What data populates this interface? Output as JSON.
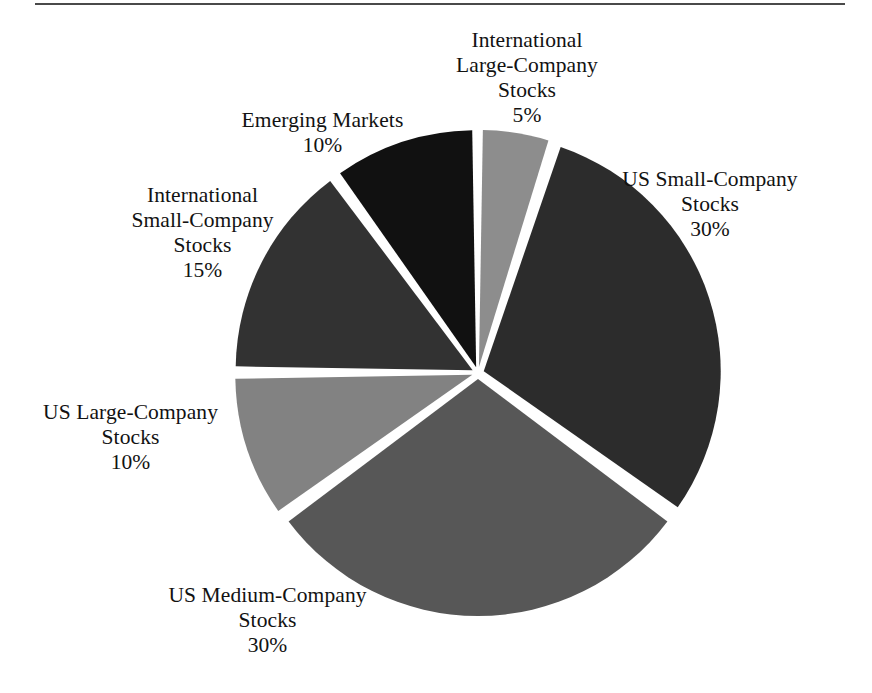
{
  "figure": {
    "has_top_rule": true,
    "background": "#ffffff"
  },
  "chart_data": {
    "type": "pie",
    "title": "",
    "xlabel": "",
    "ylabel": "",
    "units": "percent",
    "total": 100,
    "start_angle_deg": 0,
    "direction": "clockwise",
    "exploded": true,
    "gap_style": "white-separators",
    "legend": "none",
    "labels_position": "outside-callout-free",
    "categories": [
      "International Large-Company Stocks",
      "US Small-Company Stocks",
      "US Medium-Company Stocks",
      "US Large-Company Stocks",
      "International Small-Company Stocks",
      "Emerging Markets"
    ],
    "values": [
      5,
      30,
      30,
      10,
      15,
      10
    ],
    "colors": [
      "#8d8d8d",
      "#2c2c2c",
      "#575757",
      "#828282",
      "#323232",
      "#111111"
    ],
    "slices": [
      {
        "name": "International Large-Company Stocks",
        "label_line1": "International",
        "label_line2": "Large-Company",
        "label_line3": "Stocks",
        "value": 5,
        "percent": "5%",
        "color": "#8d8d8d"
      },
      {
        "name": "US Small-Company Stocks",
        "label_line1": "US Small-Company",
        "label_line2": "Stocks",
        "label_line3": "",
        "value": 30,
        "percent": "30%",
        "color": "#2c2c2c"
      },
      {
        "name": "US Medium-Company Stocks",
        "label_line1": "US Medium-Company",
        "label_line2": "Stocks",
        "label_line3": "",
        "value": 30,
        "percent": "30%",
        "color": "#575757"
      },
      {
        "name": "US Large-Company Stocks",
        "label_line1": "US Large-Company",
        "label_line2": "Stocks",
        "label_line3": "",
        "value": 10,
        "percent": "10%",
        "color": "#828282"
      },
      {
        "name": "International Small-Company Stocks",
        "label_line1": "International",
        "label_line2": "Small-Company",
        "label_line3": "Stocks",
        "value": 15,
        "percent": "15%",
        "color": "#323232"
      },
      {
        "name": "Emerging Markets",
        "label_line1": "Emerging Markets",
        "label_line2": "",
        "label_line3": "",
        "value": 10,
        "percent": "10%",
        "color": "#111111"
      }
    ]
  }
}
